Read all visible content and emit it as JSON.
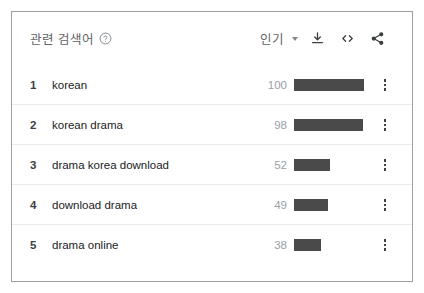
{
  "card": {
    "header": {
      "title": "관련 검색어",
      "help_icon": "help-circle-icon",
      "sort_label": "인기",
      "sort_caret_icon": "chevron-down-icon",
      "download_icon": "download-icon",
      "embed_icon": "embed-code-icon",
      "share_icon": "share-icon"
    },
    "rows": [
      {
        "rank": "1",
        "term": "korean",
        "value": "100",
        "bar_pct": 100
      },
      {
        "rank": "2",
        "term": "korean drama",
        "value": "98",
        "bar_pct": 98
      },
      {
        "rank": "3",
        "term": "drama korea download",
        "value": "52",
        "bar_pct": 52
      },
      {
        "rank": "4",
        "term": "download drama",
        "value": "49",
        "bar_pct": 49
      },
      {
        "rank": "5",
        "term": "drama online",
        "value": "38",
        "bar_pct": 38
      }
    ],
    "row_menu_icon": "more-vertical-icon"
  },
  "chart_data": {
    "type": "bar",
    "title": "관련 검색어",
    "categories": [
      "korean",
      "korean drama",
      "drama korea download",
      "download drama",
      "drama online"
    ],
    "values": [
      100,
      98,
      52,
      49,
      38
    ],
    "xlabel": "",
    "ylabel": "",
    "ylim": [
      0,
      100
    ],
    "orientation": "horizontal",
    "grid": false,
    "legend": "none",
    "bar_color": "#4a4a4a",
    "sort": "인기"
  },
  "colors": {
    "bar": "#4a4a4a",
    "border": "#9e9e9e",
    "muted_text": "#9aa0a6",
    "header_text": "#5f6368",
    "term_text": "#202124",
    "divider": "#e8eaed"
  }
}
